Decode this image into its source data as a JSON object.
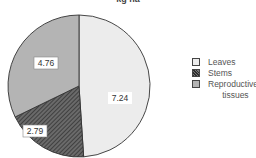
{
  "chart_data": {
    "type": "pie",
    "title": "kg ha",
    "categories": [
      "Leaves",
      "Stems",
      "Reproductive tissues"
    ],
    "values": [
      7.24,
      2.79,
      4.76
    ],
    "data_labels": [
      "7.24",
      "2.79",
      "4.76"
    ],
    "legend_position": "right",
    "colors": [
      "#ececec",
      "#555555",
      "#b4b4b4"
    ],
    "patterns": [
      "solid",
      "crosshatch",
      "solid"
    ]
  },
  "legend": {
    "items": [
      {
        "label": "Leaves"
      },
      {
        "label": "Stems"
      },
      {
        "label": "Reproductive\n      tissues"
      }
    ]
  }
}
